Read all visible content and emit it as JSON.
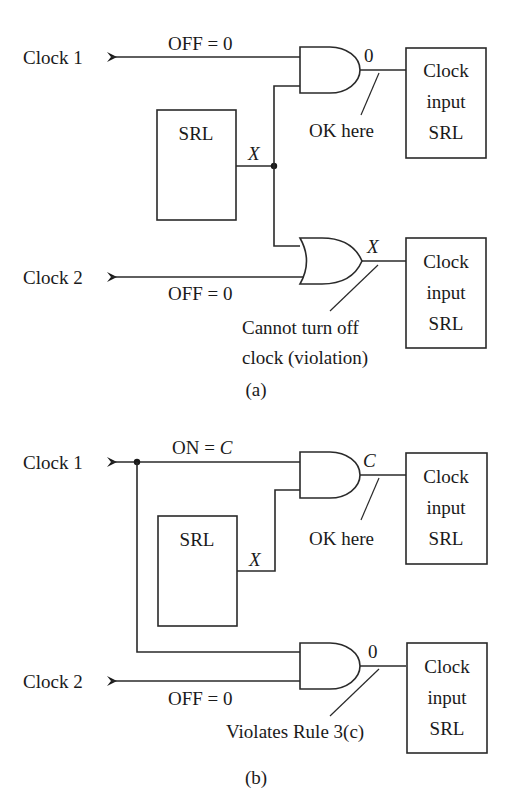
{
  "figure": {
    "panel_a": {
      "caption": "(a)",
      "clock1": {
        "label": "Clock 1",
        "wire_label": "OFF = 0"
      },
      "clock2": {
        "label": "Clock 2",
        "wire_label": "OFF = 0"
      },
      "srl": {
        "label": "SRL",
        "output": "X"
      },
      "gate_top": {
        "type": "AND",
        "output_value": "0",
        "note": "OK here"
      },
      "gate_bottom": {
        "type": "OR",
        "output_value": "X",
        "note_line1": "Cannot turn off",
        "note_line2": "clock (violation)"
      },
      "clock_input_top": {
        "line1": "Clock",
        "line2": "input",
        "line3": "SRL"
      },
      "clock_input_bottom": {
        "line1": "Clock",
        "line2": "input",
        "line3": "SRL"
      }
    },
    "panel_b": {
      "caption": "(b)",
      "clock1": {
        "label": "Clock 1",
        "wire_label_prefix": "ON = ",
        "wire_label_var": "C"
      },
      "clock2": {
        "label": "Clock 2",
        "wire_label": "OFF = 0"
      },
      "srl": {
        "label": "SRL",
        "output": "X"
      },
      "gate_top": {
        "type": "AND",
        "output_value": "C",
        "note": "OK here"
      },
      "gate_bottom": {
        "type": "AND",
        "output_value": "0",
        "note": "Violates Rule 3(c)"
      },
      "clock_input_top": {
        "line1": "Clock",
        "line2": "input",
        "line3": "SRL"
      },
      "clock_input_bottom": {
        "line1": "Clock",
        "line2": "input",
        "line3": "SRL"
      }
    }
  }
}
